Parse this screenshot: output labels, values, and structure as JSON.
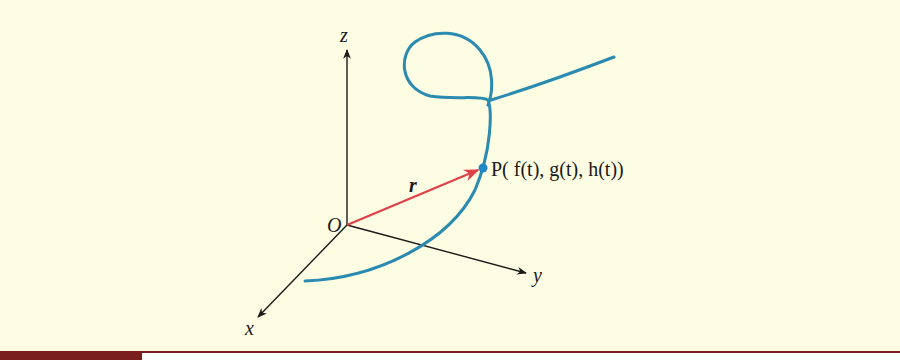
{
  "diagram": {
    "axes": {
      "z_label": "z",
      "y_label": "y",
      "x_label": "x",
      "origin_label": "O"
    },
    "vector": {
      "label": "r",
      "color": "#e0404a"
    },
    "point": {
      "label": "P( f(t), g(t), h(t))",
      "color": "#1e88c8"
    },
    "curve": {
      "color": "#2a8ab0"
    },
    "colors": {
      "background": "#fdfde3",
      "axis": "#1a1a1a",
      "footer": "#7a1e1e"
    }
  }
}
